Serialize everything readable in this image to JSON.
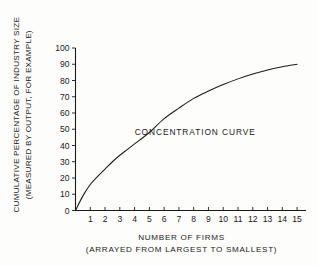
{
  "chart_data": {
    "type": "line",
    "title": "",
    "xlabel": "NUMBER OF FIRMS",
    "xlabel_sub": "(ARRAYED FROM LARGEST TO SMALLEST)",
    "ylabel": "CUMULATIVE PERCENTAGE OF INDUSTRY SIZE",
    "ylabel_sub": "(MEASURED BY OUTPUT, FOR EXAMPLE)",
    "xlim": [
      0,
      15.4
    ],
    "ylim": [
      0,
      100
    ],
    "grid": false,
    "legend": "none",
    "xticks": [
      1,
      2,
      3,
      4,
      5,
      6,
      7,
      8,
      9,
      10,
      11,
      12,
      13,
      14,
      15
    ],
    "xtick_labels": [
      "1",
      "2",
      "3",
      "4",
      "5",
      "6",
      "7",
      "8",
      "9",
      "10",
      "11",
      "12",
      "13",
      "14",
      "15"
    ],
    "yticks": [
      0,
      10,
      20,
      30,
      40,
      50,
      60,
      70,
      80,
      90,
      100
    ],
    "ytick_labels": [
      "0",
      "10",
      "20",
      "30",
      "40",
      "50",
      "60",
      "70",
      "80",
      "90",
      "100"
    ],
    "series": [
      {
        "name": "CONCENTRATION CURVE",
        "color": "#1a1a1a",
        "x": [
          0,
          0.5,
          1,
          1.5,
          2,
          2.5,
          3,
          3.5,
          4,
          5,
          6,
          7,
          8,
          9,
          10,
          11,
          12,
          13,
          14,
          15
        ],
        "values": [
          0,
          9,
          16,
          21,
          25.5,
          30,
          34,
          37.5,
          41,
          48,
          56.5,
          63,
          69,
          73.5,
          77.5,
          81,
          84,
          86.5,
          88.5,
          90
        ]
      }
    ],
    "annotations": [
      {
        "text": "CONCENTRATION CURVE",
        "x": 8.1,
        "y": 46.5
      }
    ]
  }
}
